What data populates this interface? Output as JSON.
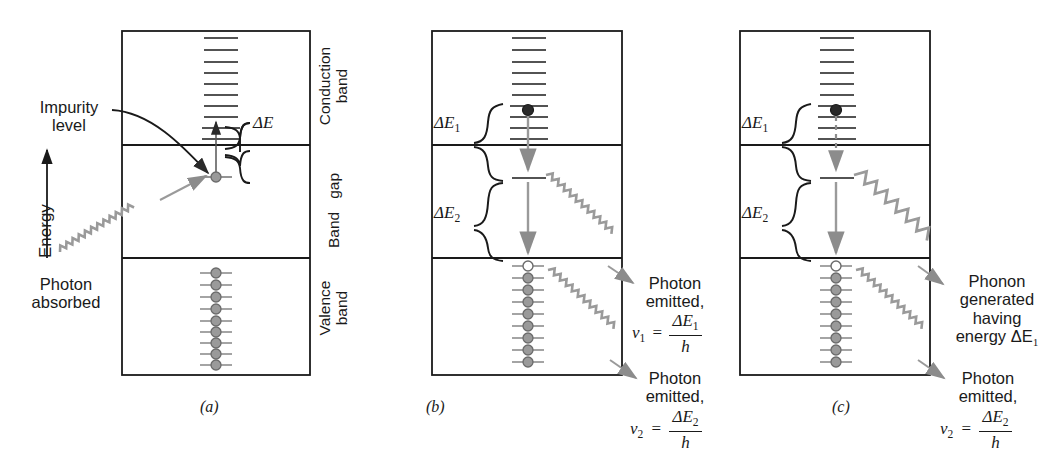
{
  "figure": {
    "axis_label": "Energy",
    "axis_icon": "up-arrow-icon"
  },
  "colors": {
    "frame": "#1a1a1a",
    "electron_fill": "#9a9a9a",
    "electron_stroke": "#6b6b6b",
    "hole_fill": "#ffffff",
    "wave": "#8c8c8c",
    "transition_arrow": "#8c8c8c",
    "text": "#1a1a1a"
  },
  "band_labels": {
    "conduction": "Conduction\nband",
    "conduction_line1": "Conduction",
    "conduction_line2": "band",
    "gap_line1": "Band",
    "gap_line2": "gap",
    "valence_line1": "Valence",
    "valence_line2": "band"
  },
  "panels": [
    {
      "id": "a",
      "caption": "(a)",
      "annotations": {
        "impurity_line1": "Impurity",
        "impurity_line2": "level",
        "photon_line1": "Photon",
        "photon_line2": "absorbed",
        "delta_e": "ΔE"
      },
      "levels": {
        "conduction_levels": 10,
        "valence_levels": 9,
        "valence_electrons": 9,
        "holes": 0,
        "impurity_level_occupied": true
      }
    },
    {
      "id": "b",
      "caption": "(b)",
      "annotations": {
        "delta_e1": "ΔE",
        "delta_e1_sub": "1",
        "delta_e2": "ΔE",
        "delta_e2_sub": "2",
        "photon1_line1": "Photon",
        "photon1_line2": "emitted,",
        "photon1_nu": "ν",
        "photon1_nu_sub": "1",
        "photon1_eq": "=",
        "photon1_num": "ΔE",
        "photon1_num_sub": "1",
        "photon1_den": "h",
        "photon2_line1": "Photon",
        "photon2_line2": "emitted,",
        "photon2_nu": "ν",
        "photon2_nu_sub": "2",
        "photon2_eq": "=",
        "photon2_num": "ΔE",
        "photon2_num_sub": "2",
        "photon2_den": "h"
      },
      "levels": {
        "conduction_levels": 10,
        "valence_levels": 9,
        "valence_electrons": 8,
        "holes": 1,
        "excited_electron_in_conduction": true
      }
    },
    {
      "id": "c",
      "caption": "(c)",
      "annotations": {
        "delta_e1": "ΔE",
        "delta_e1_sub": "1",
        "delta_e2": "ΔE",
        "delta_e2_sub": "2",
        "phonon_line1": "Phonon",
        "phonon_line2": "generated",
        "phonon_line3": "having",
        "phonon_line4": "energy ΔE",
        "phonon_line4_sub": "1",
        "photon2_line1": "Photon",
        "photon2_line2": "emitted,",
        "photon2_nu": "ν",
        "photon2_nu_sub": "2",
        "photon2_eq": "=",
        "photon2_num": "ΔE",
        "photon2_num_sub": "2",
        "photon2_den": "h"
      },
      "levels": {
        "conduction_levels": 10,
        "valence_levels": 9,
        "valence_electrons": 8,
        "holes": 1,
        "excited_electron_in_conduction": true
      }
    }
  ],
  "geometry": {
    "panel_top": 31,
    "conduction_bottom": 145,
    "gap_bottom": 258,
    "panel_bottom": 375,
    "panel_a_left": 122,
    "panel_a_right": 310,
    "panel_b_left": 432,
    "panel_b_right": 622,
    "panel_c_left": 740,
    "panel_c_right": 930
  }
}
